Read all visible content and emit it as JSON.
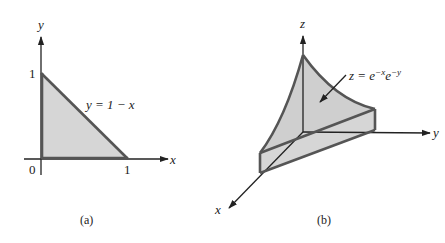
{
  "panel_a": {
    "caption": "(a)",
    "x_axis_label": "x",
    "y_axis_label": "y",
    "origin_label": "0",
    "x_tick_label": "1",
    "y_tick_label": "1",
    "curve_label": "y = 1 − x",
    "fill_color": "#d6d6d6",
    "edge_color": "#555555"
  },
  "panel_b": {
    "caption": "(b)",
    "x_axis_label": "x",
    "y_axis_label": "y",
    "z_axis_label": "z",
    "surface_label_lhs": "z = e",
    "surface_label_exp1": "−x",
    "surface_label_mid": "e",
    "surface_label_exp2": "−y",
    "fill_color": "#d6d6d6",
    "edge_color": "#555555"
  }
}
